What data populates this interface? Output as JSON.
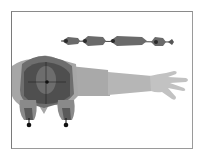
{
  "figure": {
    "colors": {
      "background": "#ffffff",
      "frame": "#8a8a8a",
      "torso_dark": "#3a3a3a",
      "torso_mid": "#6e6e6e",
      "torso_light": "#a8a8a8",
      "arm": "#b4b4b4",
      "hand": "#c4c4c4",
      "bone": "#6a6a6a",
      "bone_dark": "#3c3c3c",
      "joint": "#111111"
    },
    "bone_chain": {
      "segments": 4,
      "label": ""
    },
    "joints": [
      {
        "name": "left-foot-joint"
      },
      {
        "name": "right-foot-joint"
      },
      {
        "name": "root-joint"
      }
    ]
  }
}
